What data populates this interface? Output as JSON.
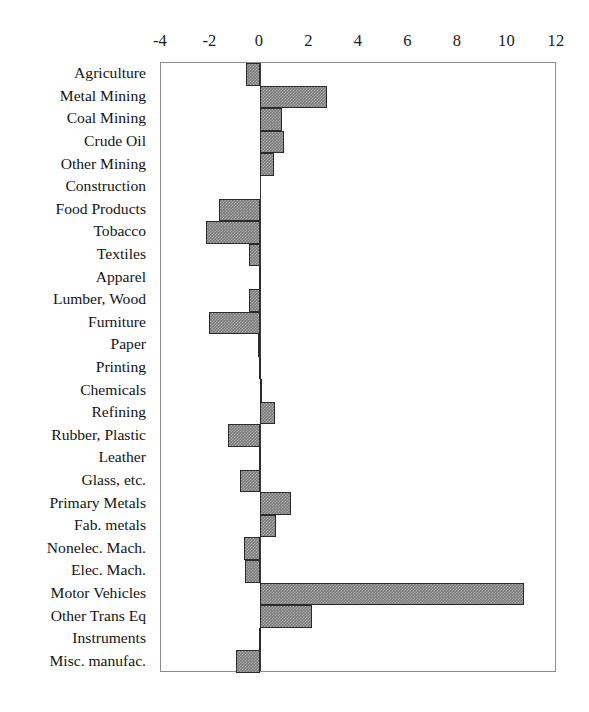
{
  "chart_data": {
    "type": "bar",
    "orientation": "horizontal",
    "title": "",
    "subtitle": "",
    "xlabel": "",
    "ylabel": "",
    "xlim": [
      -4,
      12
    ],
    "ylim": null,
    "grid": false,
    "legend": null,
    "legend_position": "none",
    "xticks": [
      -4,
      -2,
      0,
      2,
      4,
      6,
      8,
      10,
      12
    ],
    "xtick_labels": [
      "-4",
      "-2",
      "0",
      "2",
      "4",
      "6",
      "8",
      "10",
      "12"
    ],
    "zero_reference_line": 0,
    "categories": [
      "Agriculture",
      "Metal Mining",
      "Coal Mining",
      "Crude Oil",
      "Other Mining",
      "Construction",
      "Food Products",
      "Tobacco",
      "Textiles",
      "Apparel",
      "Lumber, Wood",
      "Furniture",
      "Paper",
      "Printing",
      "Chemicals",
      "Refining",
      "Rubber, Plastic",
      "Leather",
      "Glass, etc.",
      "Primary Metals",
      "Fab. metals",
      "Nonelec. Mach.",
      "Elec. Mach.",
      "Motor Vehicles",
      "Other Trans Eq",
      "Instruments",
      "Misc. manufac."
    ],
    "values": [
      -0.55,
      2.7,
      0.9,
      0.95,
      0.55,
      0.0,
      -1.65,
      -2.2,
      -0.45,
      -0.05,
      -0.45,
      -2.05,
      -0.1,
      -0.05,
      0.05,
      0.6,
      -1.3,
      -0.05,
      -0.8,
      1.25,
      0.65,
      -0.65,
      -0.6,
      10.65,
      2.1,
      -0.05,
      -0.95
    ],
    "bar_fill_color": "#7d7d7d",
    "bar_edge_color": "#2b2b2b",
    "frame_color": "#8c8c8c",
    "background_color": "#ffffff"
  }
}
